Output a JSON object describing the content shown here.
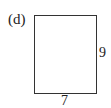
{
  "diagram": {
    "panel_label": "(d)",
    "shape": "rectangle",
    "dimensions": {
      "right_side": "9",
      "bottom_side": "7"
    },
    "colors": {
      "stroke": "#333333",
      "text": "#222222",
      "background": "#ffffff"
    }
  }
}
